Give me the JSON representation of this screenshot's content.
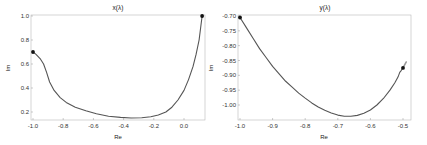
{
  "chart_data": [
    {
      "type": "line",
      "title": "x(λ)",
      "xlabel": "Re",
      "ylabel": "Im",
      "xlim": [
        -1.02,
        0.14
      ],
      "ylim": [
        0.13,
        1.005
      ],
      "grid": false,
      "xticks": [
        -1.0,
        -0.8,
        -0.6,
        -0.4,
        -0.2,
        0.0
      ],
      "xtick_labels": [
        "-1.0",
        "-0.8",
        "-0.6",
        "-0.4",
        "-0.2",
        "0.0"
      ],
      "yticks": [
        0.2,
        0.4,
        0.6,
        0.8,
        1.0
      ],
      "ytick_labels": [
        "0.2",
        "0.4",
        "0.6",
        "0.8",
        "1.0"
      ],
      "series": [
        {
          "name": "x(λ)",
          "color": "#555555",
          "x": [
            -1.0,
            -0.98,
            -0.95,
            -0.93,
            -0.91,
            -0.89,
            -0.86,
            -0.82,
            -0.78,
            -0.72,
            -0.65,
            -0.58,
            -0.5,
            -0.42,
            -0.35,
            -0.28,
            -0.22,
            -0.17,
            -0.12,
            -0.08,
            -0.04,
            0.0,
            0.03,
            0.06,
            0.08,
            0.1,
            0.11,
            0.12
          ],
          "y": [
            0.7,
            0.68,
            0.64,
            0.6,
            0.53,
            0.45,
            0.38,
            0.32,
            0.28,
            0.24,
            0.21,
            0.185,
            0.165,
            0.155,
            0.15,
            0.152,
            0.16,
            0.175,
            0.2,
            0.24,
            0.3,
            0.38,
            0.47,
            0.58,
            0.68,
            0.8,
            0.9,
            1.0
          ]
        }
      ],
      "markers": [
        {
          "label": "start",
          "x": -1.0,
          "y": 0.7
        },
        {
          "label": "end",
          "x": 0.12,
          "y": 1.0
        }
      ]
    },
    {
      "type": "line",
      "title": "y(λ)",
      "xlabel": "Re",
      "ylabel": "Im",
      "xlim": [
        -1.005,
        -0.475
      ],
      "ylim": [
        -1.048,
        -0.697
      ],
      "grid": false,
      "xticks": [
        -1.0,
        -0.9,
        -0.8,
        -0.7,
        -0.6,
        -0.5
      ],
      "xtick_labels": [
        "-1.0",
        "-0.9",
        "-0.8",
        "-0.7",
        "-0.6",
        "-0.5"
      ],
      "yticks": [
        -0.7,
        -0.75,
        -0.8,
        -0.85,
        -0.9,
        -0.95,
        -1.0
      ],
      "ytick_labels": [
        "-0.70",
        "-0.75",
        "-0.80",
        "-0.85",
        "-0.90",
        "-0.95",
        "-1.00"
      ],
      "series": [
        {
          "name": "y(λ)",
          "color": "#555555",
          "x": [
            -1.0,
            -0.98,
            -0.96,
            -0.94,
            -0.92,
            -0.9,
            -0.88,
            -0.86,
            -0.84,
            -0.82,
            -0.8,
            -0.78,
            -0.76,
            -0.74,
            -0.72,
            -0.7,
            -0.68,
            -0.66,
            -0.64,
            -0.62,
            -0.6,
            -0.58,
            -0.56,
            -0.54,
            -0.525,
            -0.515,
            -0.51,
            -0.505,
            -0.5
          ],
          "y": [
            -0.705,
            -0.74,
            -0.775,
            -0.81,
            -0.84,
            -0.87,
            -0.895,
            -0.92,
            -0.94,
            -0.96,
            -0.977,
            -0.993,
            -1.007,
            -1.018,
            -1.027,
            -1.034,
            -1.038,
            -1.038,
            -1.035,
            -1.028,
            -1.017,
            -1.0,
            -0.978,
            -0.95,
            -0.925,
            -0.905,
            -0.89,
            -0.883,
            -0.875
          ]
        },
        {
          "name": "tail",
          "color": "#999999",
          "x": [
            -0.5,
            -0.495,
            -0.49
          ],
          "y": [
            -0.875,
            -0.865,
            -0.855
          ]
        }
      ],
      "markers": [
        {
          "label": "start",
          "x": -1.0,
          "y": -0.705
        },
        {
          "label": "end",
          "x": -0.5,
          "y": -0.875
        }
      ]
    }
  ],
  "panels": [
    {
      "title": "x(λ)",
      "xlabel": "Re",
      "ylabel": "Im"
    },
    {
      "title": "y(λ)",
      "xlabel": "Re",
      "ylabel": "Im"
    }
  ]
}
